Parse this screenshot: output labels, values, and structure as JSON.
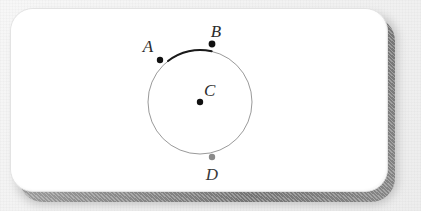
{
  "figure": {
    "background_color": "#f2f2f2",
    "card": {
      "fill": "#ffffff",
      "border_color": "#e3e3e3",
      "shadow_color": "#6e6e6e"
    },
    "circle": {
      "center_x": 200,
      "center_y": 102,
      "radius": 52,
      "stroke_color": "#9a9a9a",
      "stroke_width": 1
    },
    "highlighted_arc": {
      "from": "A",
      "to": "B",
      "start_angle_deg": 128,
      "end_angle_deg": 77,
      "stroke_color": "#1a1a1a",
      "stroke_width": 2
    },
    "points": [
      {
        "id": "A",
        "label": "A",
        "x": 160,
        "y": 60,
        "radius": 3.2,
        "color": "#111111",
        "label_x": 148,
        "label_y": 52
      },
      {
        "id": "B",
        "label": "B",
        "x": 212,
        "y": 44,
        "radius": 3.4,
        "color": "#111111",
        "label_x": 216,
        "label_y": 37
      },
      {
        "id": "C",
        "label": "C",
        "x": 200,
        "y": 102,
        "radius": 3.2,
        "color": "#111111",
        "label_x": 204,
        "label_y": 96
      },
      {
        "id": "D",
        "label": "D",
        "x": 212,
        "y": 157,
        "radius": 3.2,
        "color": "#8a8a8a",
        "label_x": 212,
        "label_y": 180
      }
    ]
  }
}
